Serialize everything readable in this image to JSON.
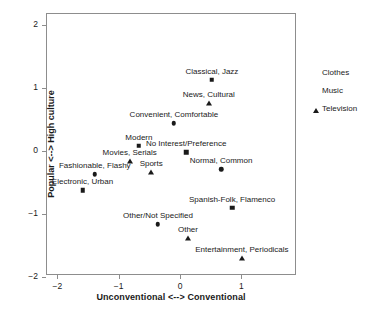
{
  "chart_data": {
    "type": "scatter",
    "title": "",
    "xlabel": "Unconventional <--> Conventional",
    "ylabel": "Popular <--> High culture",
    "xlim": [
      -2.25,
      1.83
    ],
    "ylim": [
      -2.08,
      2.16
    ],
    "xticks": [
      -2,
      -1,
      0,
      1
    ],
    "xticklabels": [
      "−2",
      "−1",
      "0",
      "1"
    ],
    "yticks": [
      2,
      1,
      0,
      -1,
      -2
    ],
    "yticklabels": [
      "2",
      "1",
      "0",
      "−1",
      "−2"
    ],
    "grid": false,
    "legend_position": "right",
    "legend": [
      {
        "label": "Clothes",
        "marker": "circle"
      },
      {
        "label": "Music",
        "marker": "square"
      },
      {
        "label": "Television",
        "marker": "triangle"
      }
    ],
    "series": [
      {
        "name": "Clothes",
        "marker": "circle",
        "points": [
          {
            "label": "Convenient, Comfortable",
            "x": -0.1,
            "y": 0.44,
            "label_dx": 0,
            "label_dy": 0
          },
          {
            "label": "Fashionable, Flashy",
            "x": -1.39,
            "y": -0.37,
            "label_dx": 0,
            "label_dy": 0
          },
          {
            "label": "Normal, Common",
            "x": 0.67,
            "y": -0.29,
            "label_dx": 0,
            "label_dy": 0
          },
          {
            "label": "Other/Not Specified",
            "x": -0.36,
            "y": -1.16,
            "label_dx": 0,
            "label_dy": 0
          }
        ]
      },
      {
        "name": "Music",
        "marker": "square",
        "points": [
          {
            "label": "Classical, Jazz",
            "x": 0.52,
            "y": 1.13,
            "label_dx": 0,
            "label_dy": 0
          },
          {
            "label": "Modern",
            "x": -0.67,
            "y": 0.08,
            "label_dx": 0,
            "label_dy": 0
          },
          {
            "label": "Electronic, Urban",
            "x": -1.59,
            "y": -0.62,
            "label_dx": 0,
            "label_dy": 0
          },
          {
            "label": "Spanish-Folk, Flamenco",
            "x": 0.85,
            "y": -0.9,
            "label_dx": 0,
            "label_dy": 0
          },
          {
            "label": "No Interest/Preference",
            "x": 0.1,
            "y": -0.02,
            "label_dx": 0,
            "label_dy": 0
          }
        ]
      },
      {
        "name": "Television",
        "marker": "triangle",
        "points": [
          {
            "label": "News, Cultural",
            "x": 0.47,
            "y": 0.76,
            "label_dx": 0,
            "label_dy": 0
          },
          {
            "label": "Movies, Serials",
            "x": -0.82,
            "y": -0.16,
            "label_dx": 0,
            "label_dy": 0
          },
          {
            "label": "Sports",
            "x": -0.47,
            "y": -0.33,
            "label_dx": 0,
            "label_dy": 0
          },
          {
            "label": "Other",
            "x": 0.13,
            "y": -1.38,
            "label_dx": 0,
            "label_dy": 0
          },
          {
            "label": "Entertainment, Periodicals",
            "x": 1.01,
            "y": -1.7,
            "label_dx": 0,
            "label_dy": 0
          }
        ]
      }
    ]
  }
}
